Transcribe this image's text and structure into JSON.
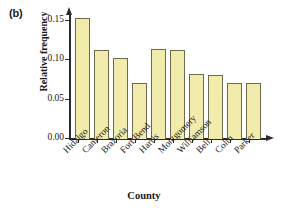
{
  "panel": {
    "label": "(b)"
  },
  "chart_data": {
    "type": "bar",
    "title": "",
    "xlabel": "County",
    "ylabel": "Relative frequency",
    "categories": [
      "Hidalgo",
      "Cameron",
      "Brazoria",
      "Fort Bend",
      "Harris",
      "Montgomery",
      "Williamson",
      "Bell",
      "Colin",
      "Parker"
    ],
    "values": [
      0.159,
      0.117,
      0.106,
      0.073,
      0.118,
      0.116,
      0.085,
      0.084,
      0.073,
      0.073
    ],
    "ylim": [
      0.0,
      0.165
    ],
    "yticks": [
      0.0,
      0.05,
      0.1,
      0.15
    ],
    "ytick_labels": [
      "0.00",
      "0.05",
      "0.10",
      "0.15"
    ],
    "grid": false,
    "legend": "none",
    "bar_fill_color": "#f2ecac",
    "bar_edge_color": "#6d6a4e",
    "axis_color": "#2b2b2b"
  }
}
